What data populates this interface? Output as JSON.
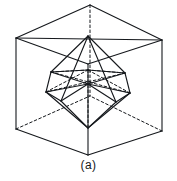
{
  "figure": {
    "caption": "(a)",
    "style": {
      "background": "#ffffff",
      "stroke": "#15181c",
      "stroke_width": 1.1,
      "hidden_stroke_width": 1.0,
      "hidden_dash": "2.6,2.4"
    },
    "cube": {
      "label": "outer-cube",
      "vertices": {
        "front_top_left": [
          16,
          38
        ],
        "front_top_right": [
          162,
          40
        ],
        "front_bottom_left": [
          16,
          129
        ],
        "front_bottom_right": [
          162,
          131
        ],
        "back_top_left": [
          43,
          6
        ],
        "back_top_right": [
          90,
          5
        ],
        "back_bottom_left": [
          43,
          97
        ],
        "back_bottom_right": [
          90,
          96
        ],
        "near_bottom_front": [
          88,
          155
        ],
        "near_top_front": [
          88,
          64
        ]
      },
      "visible_edges": [
        [
          16,
          38,
          162,
          40
        ],
        [
          16,
          38,
          16,
          129
        ],
        [
          162,
          40,
          162,
          131
        ],
        [
          16,
          38,
          88,
          64
        ],
        [
          162,
          40,
          88,
          64
        ],
        [
          16,
          129,
          88,
          155
        ],
        [
          162,
          131,
          88,
          155
        ],
        [
          88,
          64,
          88,
          155
        ],
        [
          16,
          38,
          90,
          5
        ],
        [
          162,
          40,
          90,
          5
        ]
      ],
      "hidden_edges": [
        [
          90,
          5,
          90,
          96
        ],
        [
          16,
          129,
          90,
          96
        ],
        [
          162,
          131,
          90,
          96
        ]
      ]
    },
    "polyhedron": {
      "label": "inner-polyhedron",
      "vertices": {
        "apex_top": [
          88,
          36
        ],
        "apex_bottom": [
          88,
          128
        ],
        "waist_left": [
          46,
          92
        ],
        "waist_right": [
          130,
          93
        ],
        "waist_front_left": [
          61,
          101
        ],
        "waist_front_right": [
          116,
          102
        ],
        "waist_back_left": [
          57,
          73
        ],
        "waist_back_right": [
          119,
          74
        ],
        "upper_left": [
          51,
          72
        ],
        "upper_right": [
          125,
          73
        ],
        "mid_front": [
          88,
          84
        ],
        "mid_back": [
          88,
          70
        ]
      },
      "visible_edges": [
        [
          88,
          36,
          51,
          72
        ],
        [
          88,
          36,
          125,
          73
        ],
        [
          88,
          36,
          61,
          101
        ],
        [
          88,
          36,
          116,
          102
        ],
        [
          51,
          72,
          46,
          92
        ],
        [
          125,
          73,
          130,
          93
        ],
        [
          46,
          92,
          61,
          101
        ],
        [
          130,
          93,
          116,
          102
        ],
        [
          61,
          101,
          88,
          84
        ],
        [
          116,
          102,
          88,
          84
        ],
        [
          51,
          72,
          88,
          84
        ],
        [
          125,
          73,
          88,
          84
        ],
        [
          61,
          101,
          88,
          128
        ],
        [
          116,
          102,
          88,
          128
        ],
        [
          46,
          92,
          88,
          128
        ],
        [
          130,
          93,
          88,
          128
        ],
        [
          46,
          92,
          88,
          84
        ],
        [
          130,
          93,
          88,
          84
        ],
        [
          51,
          72,
          88,
          70
        ],
        [
          125,
          73,
          88,
          70
        ]
      ],
      "hidden_edges": [
        [
          51,
          72,
          88,
          70
        ],
        [
          125,
          73,
          88,
          70
        ],
        [
          88,
          70,
          88,
          128
        ],
        [
          46,
          92,
          88,
          70
        ],
        [
          130,
          93,
          88,
          70
        ],
        [
          51,
          72,
          130,
          93
        ],
        [
          125,
          73,
          46,
          92
        ]
      ]
    }
  }
}
